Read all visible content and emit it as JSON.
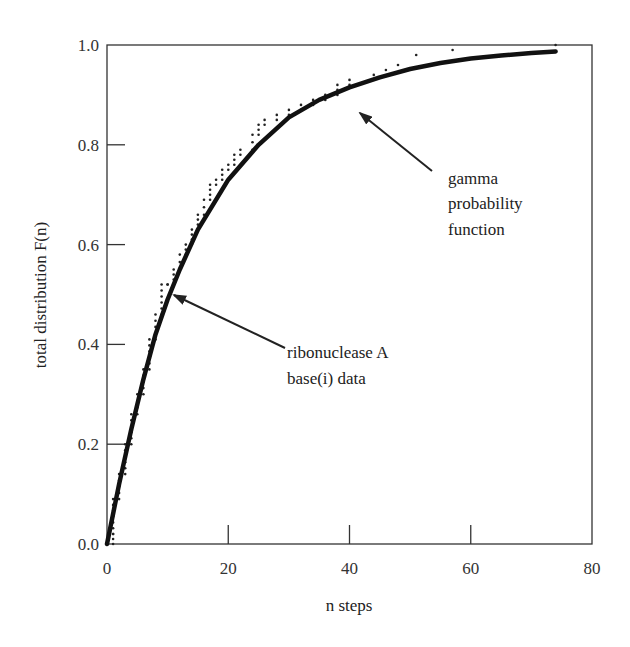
{
  "chart_data": {
    "type": "line",
    "title": "",
    "xlabel": "n steps",
    "ylabel": "total distribution F(n)",
    "xlim": [
      0,
      80
    ],
    "ylim": [
      0.0,
      1.0
    ],
    "x_ticks": [
      "0",
      "20",
      "40",
      "60",
      "80"
    ],
    "y_ticks": [
      "0.0",
      "0.2",
      "0.4",
      "0.6",
      "0.8",
      "1.0"
    ],
    "grid": false,
    "legend": null,
    "series": [
      {
        "name": "gamma probability function",
        "style": "thick-line",
        "x": [
          0,
          2,
          4,
          6,
          8,
          10,
          12,
          15,
          20,
          25,
          30,
          35,
          40,
          45,
          50,
          55,
          60,
          65,
          70,
          74
        ],
        "y": [
          0.0,
          0.12,
          0.23,
          0.33,
          0.42,
          0.49,
          0.55,
          0.63,
          0.73,
          0.8,
          0.855,
          0.89,
          0.915,
          0.935,
          0.952,
          0.964,
          0.973,
          0.979,
          0.984,
          0.987
        ]
      },
      {
        "name": "ribonuclease A base(i) data",
        "style": "dots",
        "x": [
          1,
          1,
          2,
          3,
          4,
          5,
          6,
          7,
          8,
          9,
          10,
          11,
          12,
          13,
          14,
          15,
          16,
          17,
          18,
          19,
          20,
          21,
          22,
          24,
          25,
          26,
          28,
          30,
          32,
          34,
          36,
          38,
          40,
          44,
          46,
          48,
          51,
          57,
          74
        ],
        "y": [
          0.02,
          0.09,
          0.14,
          0.2,
          0.26,
          0.3,
          0.35,
          0.41,
          0.46,
          0.52,
          0.52,
          0.55,
          0.58,
          0.6,
          0.63,
          0.66,
          0.69,
          0.72,
          0.73,
          0.75,
          0.76,
          0.78,
          0.79,
          0.82,
          0.84,
          0.85,
          0.86,
          0.87,
          0.88,
          0.89,
          0.9,
          0.92,
          0.93,
          0.94,
          0.95,
          0.96,
          0.98,
          0.99,
          1.0
        ]
      }
    ],
    "annotations": [
      {
        "lines": [
          "gamma",
          "probability",
          "function"
        ],
        "points_to": "gamma probability function"
      },
      {
        "lines": [
          "ribonuclease A",
          "base(i) data"
        ],
        "points_to": "ribonuclease A base(i) data"
      }
    ]
  }
}
